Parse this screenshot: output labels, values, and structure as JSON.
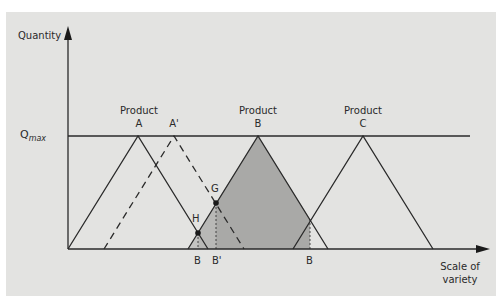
{
  "axes": {
    "y_label": "Quantity",
    "x_label_line1": "Scale of",
    "x_label_line2": "variety",
    "qmax_main": "Q",
    "qmax_sub": "max"
  },
  "products": {
    "a": {
      "line1": "Product",
      "line2": "A"
    },
    "a_prime": {
      "label": "A'"
    },
    "b": {
      "line1": "Product",
      "line2": "B"
    },
    "c": {
      "line1": "Product",
      "line2": "C"
    }
  },
  "points": {
    "g": "G",
    "h": "H"
  },
  "x_markers": {
    "b_left": "B",
    "b_prime": "B'",
    "b_right": "B"
  },
  "colors": {
    "panel": "#e3e3e1",
    "shade_dark": "#a9a9a7",
    "shade_light": "#c4c4c2",
    "line": "#2a2a2a"
  }
}
